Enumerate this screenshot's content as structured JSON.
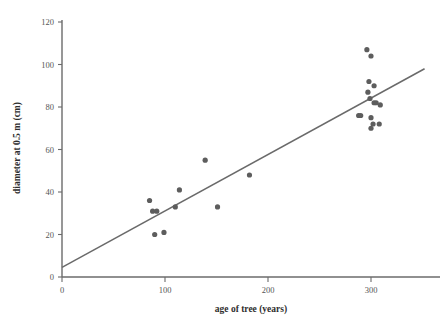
{
  "chart_data": {
    "type": "scatter",
    "title": "",
    "xlabel": "age of tree (years)",
    "ylabel": "diameter at 0.5 m (cm)",
    "xlim": [
      0,
      370
    ],
    "ylim": [
      0,
      120
    ],
    "xticks": [
      0,
      100,
      200,
      300
    ],
    "yticks": [
      0,
      20,
      40,
      60,
      80,
      100,
      120
    ],
    "xtick_labels": [
      "0",
      "100",
      "200",
      "300"
    ],
    "ytick_labels": [
      "0",
      "20",
      "40",
      "60",
      "80",
      "100",
      "120"
    ],
    "grid": false,
    "legend": null,
    "point_color": "#5d5d5d",
    "line_color": "#6a6a6a",
    "axis_color": "#6b6b6b",
    "points": [
      {
        "x": 85,
        "y": 36
      },
      {
        "x": 88,
        "y": 31
      },
      {
        "x": 92,
        "y": 31
      },
      {
        "x": 90,
        "y": 20
      },
      {
        "x": 99,
        "y": 21
      },
      {
        "x": 110,
        "y": 33
      },
      {
        "x": 114,
        "y": 41
      },
      {
        "x": 139,
        "y": 55
      },
      {
        "x": 151,
        "y": 33
      },
      {
        "x": 182,
        "y": 48
      },
      {
        "x": 296,
        "y": 107
      },
      {
        "x": 300,
        "y": 104
      },
      {
        "x": 298,
        "y": 92
      },
      {
        "x": 303,
        "y": 90
      },
      {
        "x": 297,
        "y": 87
      },
      {
        "x": 299,
        "y": 84
      },
      {
        "x": 303,
        "y": 82
      },
      {
        "x": 305,
        "y": 82
      },
      {
        "x": 309,
        "y": 81
      },
      {
        "x": 288,
        "y": 76
      },
      {
        "x": 290,
        "y": 76
      },
      {
        "x": 300,
        "y": 75
      },
      {
        "x": 302,
        "y": 72
      },
      {
        "x": 308,
        "y": 72
      },
      {
        "x": 300,
        "y": 70
      }
    ],
    "trend_line": {
      "x_start": 0,
      "y_start": 4.5,
      "x_end": 352,
      "y_end": 98
    }
  },
  "axes": {
    "x_axis_name": "x-axis",
    "y_axis_name": "y-axis"
  }
}
